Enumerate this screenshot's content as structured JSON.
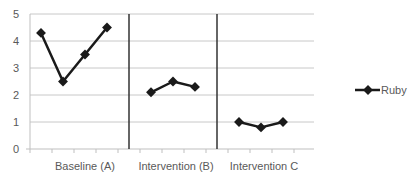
{
  "chart_data": {
    "type": "line",
    "title": "",
    "xlabel": "",
    "ylabel": "",
    "ylim": [
      0,
      5
    ],
    "yticks": [
      0,
      1,
      2,
      3,
      4,
      5
    ],
    "grid": true,
    "legend_position": "right",
    "phases": [
      {
        "label": "Baseline (A)",
        "values": [
          4.3,
          2.5,
          3.5,
          4.5
        ]
      },
      {
        "label": "Intervention (B)",
        "values": [
          2.1,
          2.5,
          2.3
        ]
      },
      {
        "label": "Intervention C",
        "values": [
          1.0,
          0.8,
          1.0
        ]
      }
    ],
    "series": [
      {
        "name": "Ruby",
        "values": [
          4.3,
          2.5,
          3.5,
          4.5,
          null,
          2.1,
          2.5,
          2.3,
          null,
          1.0,
          0.8,
          1.0,
          null
        ],
        "color": "#1a1a1a"
      }
    ],
    "phase_change_lines_after_category": [
      4,
      8
    ]
  },
  "legend": {
    "label": "Ruby"
  },
  "colors": {
    "line": "#1a1a1a",
    "grid": "#c8c8c8",
    "axis": "#bfbfbf",
    "phase_line": "#333333",
    "text": "#595959"
  }
}
